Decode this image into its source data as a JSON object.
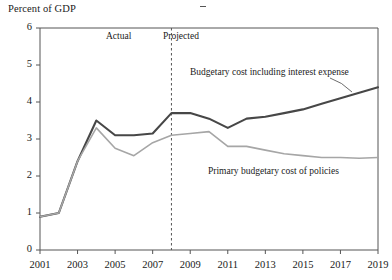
{
  "chart_data": {
    "type": "line",
    "title": "",
    "ylabel": "Percent of GDP",
    "xlabel": "",
    "ylim": [
      0,
      6
    ],
    "xlim": [
      2001,
      2019
    ],
    "ytick_labels": [
      "0",
      "1",
      "2",
      "3",
      "4",
      "5",
      "6"
    ],
    "ytick_values": [
      0,
      1,
      2,
      3,
      4,
      5,
      6
    ],
    "xtick_labels": [
      "2001",
      "2003",
      "2005",
      "2007",
      "2009",
      "2011",
      "2013",
      "2015",
      "2017",
      "2019"
    ],
    "xtick_values": [
      2001,
      2003,
      2005,
      2007,
      2009,
      2011,
      2013,
      2015,
      2017,
      2019
    ],
    "grid": false,
    "legend_position": "inline-annotation",
    "x": [
      2001,
      2002,
      2003,
      2004,
      2005,
      2006,
      2007,
      2008,
      2009,
      2010,
      2011,
      2012,
      2013,
      2014,
      2015,
      2016,
      2017,
      2018,
      2019
    ],
    "series": [
      {
        "name": "Budgetary cost including interest expense",
        "color": "#474747",
        "width": 2.1,
        "values": [
          0.9,
          1.0,
          2.4,
          3.5,
          3.1,
          3.1,
          3.15,
          3.7,
          3.7,
          3.55,
          3.3,
          3.55,
          3.6,
          3.7,
          3.8,
          3.95,
          4.1,
          4.25,
          4.4
        ]
      },
      {
        "name": "Primary budgetary cost of policies",
        "color": "#a6a6a6",
        "width": 1.6,
        "values": [
          0.9,
          1.0,
          2.4,
          3.3,
          2.75,
          2.55,
          2.9,
          3.1,
          3.15,
          3.2,
          2.8,
          2.8,
          2.7,
          2.6,
          2.55,
          2.5,
          2.5,
          2.48,
          2.5
        ]
      }
    ],
    "annotations": [
      {
        "name": "divider",
        "type": "vline",
        "x": 2008,
        "style": "dashed",
        "color": "#555555"
      },
      {
        "name": "actual-label",
        "text": "Actual",
        "x": 2005.3,
        "y": 5.35
      },
      {
        "name": "projected-label",
        "text": "Projected",
        "x": 2009.0,
        "y": 5.35
      }
    ]
  },
  "labels": {
    "axis_title": "Percent of GDP",
    "actual": "Actual",
    "projected": "Projected",
    "series_0": "Budgetary cost including interest expense",
    "series_1": "Primary budgetary cost of policies"
  }
}
